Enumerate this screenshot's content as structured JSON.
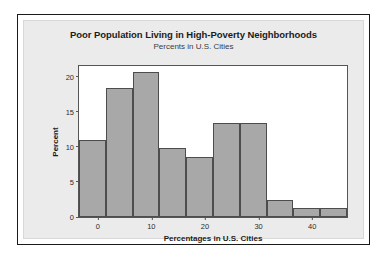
{
  "chart_data": {
    "type": "bar",
    "title": "Poor Population Living in High-Poverty Neighborhoods",
    "subtitle": "Percents in U.S. Cities",
    "xlabel": "Percentages in U.S. Cities",
    "ylabel": "Percent",
    "grid": false,
    "legend": "none",
    "xlim": [
      -3.5,
      46.5
    ],
    "ylim": [
      0,
      21.5
    ],
    "xticks": [
      "0",
      "10",
      "20",
      "30",
      "40"
    ],
    "xtick_values": [
      0,
      10,
      20,
      30,
      40
    ],
    "yticks": [
      "0",
      "5",
      "10",
      "15",
      "20"
    ],
    "ytick_values": [
      0,
      5,
      10,
      15,
      20
    ],
    "bin_width": 5,
    "bin_edges": [
      -3.5,
      1.5,
      6.5,
      11.5,
      16.5,
      21.5,
      26.5,
      31.5,
      36.5,
      41.5,
      46.5
    ],
    "categories": [
      "-3.5 to 1.5",
      "1.5 to 6.5",
      "6.5 to 11.5",
      "11.5 to 16.5",
      "16.5 to 21.5",
      "21.5 to 26.5",
      "26.5 to 31.5",
      "31.5 to 36.5",
      "36.5 to 41.5",
      "41.5 to 46.5"
    ],
    "values": [
      11.0,
      18.3,
      20.7,
      9.8,
      8.6,
      13.4,
      13.4,
      2.4,
      1.3,
      1.3
    ],
    "bar_color": "#a8a8a8",
    "bar_edge_color": "#4d4d4d",
    "panel_color": "#ebebeb",
    "plot_background": "#ffffff"
  }
}
